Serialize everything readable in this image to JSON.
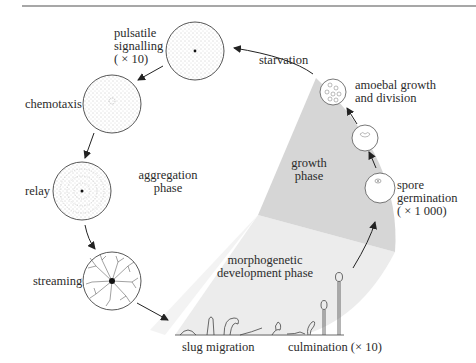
{
  "diagram": {
    "type": "life-cycle",
    "title": "",
    "phases": [
      {
        "id": "aggregation",
        "label_lines": [
          "aggregation",
          "phase"
        ]
      },
      {
        "id": "growth",
        "label_lines": [
          "growth",
          "phase"
        ]
      },
      {
        "id": "morphogenetic",
        "label_lines": [
          "morphogenetic",
          "development phase"
        ]
      }
    ],
    "stages": [
      {
        "id": "starvation",
        "label_lines": [
          "starvation"
        ]
      },
      {
        "id": "pulsatile",
        "label_lines": [
          "pulsatile",
          "signalling",
          "( × 10)"
        ]
      },
      {
        "id": "chemotaxis",
        "label_lines": [
          "chemotaxis"
        ]
      },
      {
        "id": "relay",
        "label_lines": [
          "relay"
        ]
      },
      {
        "id": "streaming",
        "label_lines": [
          "streaming"
        ]
      },
      {
        "id": "slug",
        "label_lines": [
          "slug migration"
        ]
      },
      {
        "id": "culmination",
        "label_lines": [
          "culmination (× 10)"
        ]
      },
      {
        "id": "spore",
        "label_lines": [
          "spore",
          "germination",
          "( × 1 000)"
        ]
      },
      {
        "id": "amoebal",
        "label_lines": [
          "amoebal growth",
          "and division"
        ]
      }
    ],
    "colors": {
      "growth_shade": "#d6d6d6",
      "morpho_shade": "#ececec",
      "line": "#333333",
      "rule": "#8a8a8a"
    }
  }
}
